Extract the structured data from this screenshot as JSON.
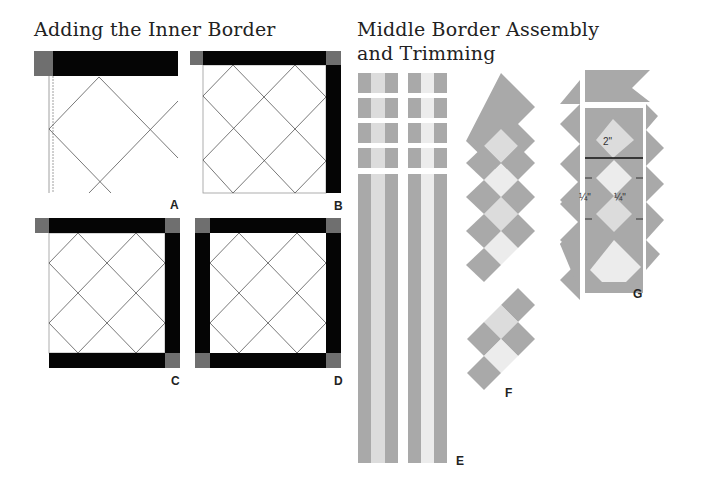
{
  "section_inner": {
    "title": "Adding the Inner Border",
    "panels": [
      {
        "id": "A",
        "label": "A"
      },
      {
        "id": "B",
        "label": "B"
      },
      {
        "id": "C",
        "label": "C"
      },
      {
        "id": "D",
        "label": "D"
      }
    ]
  },
  "section_middle": {
    "title_line1": "Middle Border Assembly",
    "title_line2": "and Trimming",
    "panels": [
      {
        "id": "E",
        "label": "E"
      },
      {
        "id": "F",
        "label": "F"
      },
      {
        "id": "G",
        "label": "G"
      }
    ],
    "measurements": {
      "square_size": "2\"",
      "seam_left": "¼\"",
      "seam_right": "¼\""
    }
  },
  "colors": {
    "border_black": "#050505",
    "corner_gray": "#6f6f6f",
    "fabric_gray": "#a9a9a9",
    "fabric_light": "#dcdcdc",
    "fabric_lighter": "#ececec",
    "line": "#555555"
  }
}
